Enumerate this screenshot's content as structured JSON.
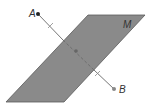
{
  "diagram": {
    "plane": {
      "label": "M",
      "fill": "#8a8a8a",
      "stroke": "#555555",
      "points": "88,15 145,15 64,102 6,102"
    },
    "segment": {
      "from": "A",
      "to": "B",
      "color": "#777777",
      "ticks": "congruent halves marked"
    },
    "points": {
      "A": {
        "label": "A",
        "x": 38,
        "y": 14,
        "color": "#222222"
      },
      "B": {
        "label": "B",
        "x": 114,
        "y": 89,
        "color": "#888888"
      },
      "midpoint": {
        "x": 76,
        "y": 51
      }
    }
  }
}
